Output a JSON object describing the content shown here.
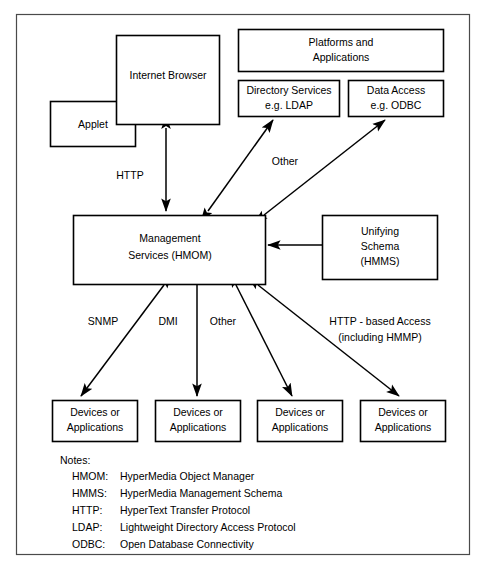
{
  "diagram": {
    "nodes": {
      "internet_browser": {
        "label": "Internet Browser"
      },
      "applet": {
        "label": "Applet"
      },
      "platforms": {
        "line1": "Platforms and",
        "line2": "Applications"
      },
      "directory_services": {
        "line1": "Directory Services",
        "line2": "e.g. LDAP"
      },
      "data_access": {
        "line1": "Data Access",
        "line2": "e.g. ODBC"
      },
      "management_services": {
        "line1": "Management",
        "line2": "Services (HMOM)"
      },
      "unifying_schema": {
        "line1": "Unifying",
        "line2": "Schema",
        "line3": "(HMMS)"
      },
      "device1": {
        "line1": "Devices or",
        "line2": "Applications"
      },
      "device2": {
        "line1": "Devices or",
        "line2": "Applications"
      },
      "device3": {
        "line1": "Devices or",
        "line2": "Applications"
      },
      "device4": {
        "line1": "Devices or",
        "line2": "Applications"
      }
    },
    "edge_labels": {
      "http": "HTTP",
      "other_top": "Other",
      "snmp": "SNMP",
      "dmi": "DMI",
      "other_bottom": "Other",
      "http_access_line1": "HTTP - based Access",
      "http_access_line2": "(including HMMP)"
    },
    "notes": {
      "heading": "Notes:",
      "entries": [
        {
          "term": "HMOM:",
          "definition": "HyperMedia Object Manager"
        },
        {
          "term": "HMMS:",
          "definition": "HyperMedia Management Schema"
        },
        {
          "term": "HTTP:",
          "definition": "HyperText Transfer Protocol"
        },
        {
          "term": "LDAP:",
          "definition": "Lightweight Directory Access Protocol"
        },
        {
          "term": "ODBC:",
          "definition": "Open Database Connectivity"
        }
      ]
    },
    "colors": {
      "stroke": "#000000",
      "background": "#ffffff",
      "frame": "#4a4a4a"
    }
  }
}
